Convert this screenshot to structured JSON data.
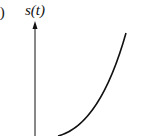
{
  "diagram": {
    "panel_label": "c)",
    "y_axis_label": "s(t)",
    "curve": "convex increasing curve (parabola-like)",
    "colors": {
      "stroke": "#111111",
      "background": "#ffffff"
    }
  }
}
